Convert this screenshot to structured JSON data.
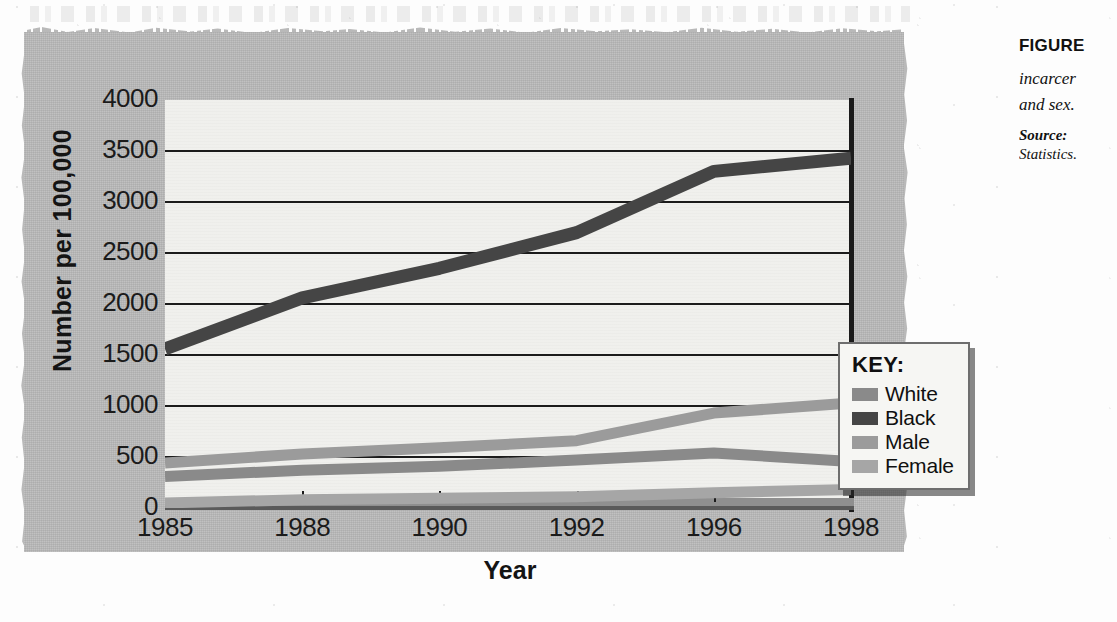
{
  "figure": {
    "caption_label": "FIGURE",
    "caption_desc_line1": "incarcer",
    "caption_desc_line2": "and sex.",
    "source_label": "Source:",
    "source_line2": "Statistics."
  },
  "legend": {
    "title": "KEY:",
    "items": [
      {
        "label": "White",
        "color": "#8a8a8a"
      },
      {
        "label": "Black",
        "color": "#454545"
      },
      {
        "label": "Male",
        "color": "#9b9b9b"
      },
      {
        "label": "Female",
        "color": "#a6a6a6"
      }
    ]
  },
  "chart_data": {
    "type": "line",
    "title": "",
    "xlabel": "Year",
    "ylabel": "Number per 100,000",
    "x": [
      1985,
      1988,
      1990,
      1992,
      1996,
      1998
    ],
    "xtick_labels": [
      "1985",
      "1988",
      "1990",
      "1992",
      "1996",
      "1998"
    ],
    "ytick_labels": [
      "4000",
      "3500",
      "3000",
      "2500",
      "2000",
      "1500",
      "1000",
      "500",
      "0"
    ],
    "yticks": [
      4000,
      3500,
      3000,
      2500,
      2000,
      1500,
      1000,
      500,
      0
    ],
    "ylim": [
      0,
      4000
    ],
    "xlim": [
      1985,
      1998
    ],
    "grid": "horizontal",
    "legend_position": "inside-right",
    "series": [
      {
        "name": "White",
        "color": "#8a8a8a",
        "values": [
          310,
          370,
          410,
          470,
          540,
          455
        ]
      },
      {
        "name": "Black",
        "color": "#454545",
        "values": [
          1560,
          2060,
          2350,
          2700,
          3300,
          3430
        ]
      },
      {
        "name": "Male",
        "color": "#9b9b9b",
        "values": [
          440,
          530,
          590,
          660,
          930,
          1030
        ]
      },
      {
        "name": "Female",
        "color": "#a6a6a6",
        "values": [
          50,
          80,
          95,
          110,
          150,
          180
        ]
      }
    ]
  }
}
